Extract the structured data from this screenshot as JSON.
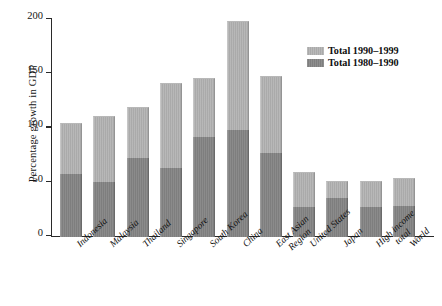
{
  "chart_data": {
    "type": "bar",
    "stacked": true,
    "title": "",
    "subtitle": "",
    "xlabel": "",
    "ylabel": "Percentage growth in GDP",
    "ylim": [
      0,
      200
    ],
    "yticks": [
      0,
      50,
      100,
      150,
      200
    ],
    "ytick_labels": [
      "0",
      "50",
      "100",
      "150",
      "200"
    ],
    "grid": false,
    "legend_position": "top-right",
    "categories": [
      "Indonesia",
      "Malaysia",
      "Thailand",
      "Singapore",
      "South Korea",
      "China",
      "East Asian Region",
      "United States",
      "Japan",
      "High income total",
      "World"
    ],
    "category_lines": [
      [
        "Indonesia"
      ],
      [
        "Malaysia"
      ],
      [
        "Thailand"
      ],
      [
        "Singapore"
      ],
      [
        "South Korea"
      ],
      [
        "China"
      ],
      [
        "East Asian",
        "Region"
      ],
      [
        "United States"
      ],
      [
        "Japan"
      ],
      [
        "High income",
        "total"
      ],
      [
        "World"
      ]
    ],
    "series": [
      {
        "name": "Total 1980–1990",
        "color": "#7e7e7e",
        "values": [
          58,
          51,
          73,
          64,
          92,
          99,
          77,
          28,
          36,
          28,
          29
        ]
      },
      {
        "name": "Total 1990–1999",
        "color": "#aaaaaa",
        "values": [
          47,
          61,
          47,
          78,
          55,
          100,
          71,
          32,
          16,
          24,
          25
        ]
      }
    ],
    "totals": [
      105,
      112,
      120,
      142,
      147,
      199,
      148,
      60,
      52,
      52,
      54
    ]
  },
  "legend": {
    "entries": [
      {
        "label": "Total 1990–1999",
        "swatch": "light"
      },
      {
        "label": "Total 1980–1990",
        "swatch": "dark"
      }
    ]
  },
  "colors": {
    "light_gray": "#aaaaaa",
    "dark_gray": "#7e7e7e",
    "axis": "#2a2a2a",
    "text": "#121212",
    "background": "#ffffff"
  }
}
